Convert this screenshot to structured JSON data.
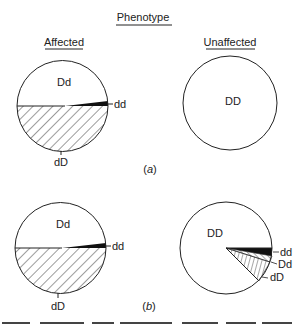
{
  "title": "Phenotype",
  "columns": {
    "affected": "Affected",
    "unaffected": "Unaffected"
  },
  "panels": [
    {
      "caption": "(a)",
      "caption_letter": "a",
      "affected": {
        "labels": {
          "top": "Dd",
          "wedge": "dd",
          "bottom": "dD"
        }
      },
      "unaffected": {
        "labels": {
          "center": "DD"
        }
      }
    },
    {
      "caption": "(b)",
      "caption_letter": "b",
      "affected": {
        "labels": {
          "top": "Dd",
          "wedge": "dd",
          "bottom": "dD"
        }
      },
      "unaffected": {
        "labels": {
          "main": "DD",
          "wedge1": "dd",
          "wedge2": "Dd",
          "wedge3": "dD"
        }
      }
    }
  ],
  "footer_fragment": "(cut-off text line)",
  "colors": {
    "line": "#222222",
    "fill_dark": "#111111",
    "background": "#ffffff"
  }
}
